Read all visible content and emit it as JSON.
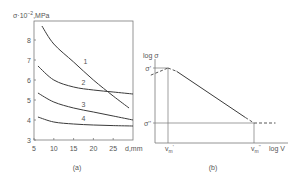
{
  "chart_data": [
    {
      "type": "line",
      "panel_caption": "(a)",
      "title": "",
      "ylabel": "σ·10⁻²,MPa",
      "ylabel_prefix": "σ·10",
      "ylabel_exp": "−2",
      "ylabel_unit": ",MPa",
      "xlabel": "d,mm",
      "xlim": [
        5,
        30
      ],
      "ylim": [
        3,
        9
      ],
      "xticks": [
        5,
        10,
        15,
        20,
        25
      ],
      "yticks": [
        3,
        4,
        5,
        6,
        7,
        8
      ],
      "grid": false,
      "legend": "inline curve numbers",
      "series": [
        {
          "name": "1",
          "x": [
            7,
            10,
            15,
            20,
            25,
            29
          ],
          "y": [
            8.7,
            7.8,
            6.9,
            6.0,
            5.2,
            4.6
          ],
          "label_at": [
            18,
            6.8
          ]
        },
        {
          "name": "2",
          "x": [
            6,
            10,
            15,
            20,
            25,
            30
          ],
          "y": [
            6.7,
            6.0,
            5.65,
            5.5,
            5.4,
            5.3
          ],
          "label_at": [
            17.5,
            5.75
          ]
        },
        {
          "name": "3",
          "x": [
            6,
            10,
            15,
            20,
            25,
            30
          ],
          "y": [
            5.35,
            4.9,
            4.6,
            4.4,
            4.2,
            4.0
          ],
          "label_at": [
            17.5,
            4.65
          ]
        },
        {
          "name": "4",
          "x": [
            6,
            10,
            15,
            20,
            25,
            30
          ],
          "y": [
            4.15,
            3.9,
            3.8,
            3.75,
            3.72,
            3.7
          ],
          "label_at": [
            17.5,
            3.95
          ]
        }
      ]
    },
    {
      "type": "line",
      "panel_caption": "(b)",
      "title": "",
      "ylabel": "log σ",
      "xlabel": "log V",
      "grid": false,
      "schematic": true,
      "y_markers": [
        {
          "label": "σ'",
          "level": 1.0
        },
        {
          "label": "σ''",
          "level": 0.0
        }
      ],
      "x_markers": [
        {
          "label": "v",
          "sub": "m",
          "sup": "'",
          "position": 0.0
        },
        {
          "label": "v",
          "sub": "m",
          "sup": "''",
          "position": 1.0
        }
      ],
      "segments": [
        {
          "name": "plateau-high",
          "style": "solid",
          "from": [
            -0.18,
            1.0
          ],
          "to": [
            0.0,
            1.0
          ]
        },
        {
          "name": "rise-dashed",
          "style": "dashed",
          "from": [
            -0.2,
            0.87
          ],
          "to": [
            0.0,
            1.0
          ]
        },
        {
          "name": "knee-dashed",
          "style": "dashed",
          "from": [
            0.0,
            1.0
          ],
          "to": [
            0.1,
            0.94
          ]
        },
        {
          "name": "slope",
          "style": "solid",
          "from": [
            0.1,
            0.94
          ],
          "to": [
            0.9,
            0.1
          ]
        },
        {
          "name": "slope-end-dashed",
          "style": "dashed",
          "from": [
            0.9,
            0.1
          ],
          "to": [
            1.0,
            0.0
          ]
        },
        {
          "name": "plateau-low-dashed",
          "style": "dashed",
          "from": [
            1.0,
            0.0
          ],
          "to": [
            1.25,
            0.0
          ]
        }
      ]
    }
  ]
}
